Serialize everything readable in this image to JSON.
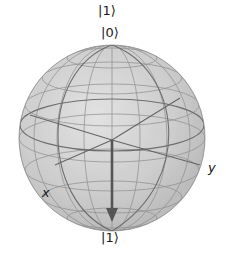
{
  "diagram": {
    "type": "bloch-sphere",
    "title_label": "|1⟩",
    "north_pole_label": "|0⟩",
    "south_pole_label": "|1⟩",
    "x_axis_label": "x",
    "y_axis_label": "y",
    "state_vector": {
      "theta_deg": 180,
      "phi_deg": 0,
      "points_to": "|1⟩"
    },
    "colors": {
      "sphere_fill": "#cfcfcf",
      "sphere_edge": "#9a9a9a",
      "wireframe": "#7a7a7a",
      "vector": "#555555",
      "text": "#1a1a1a"
    }
  }
}
